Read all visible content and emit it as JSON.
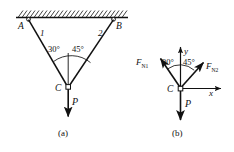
{
  "figure": {
    "background_color": "#ffffff",
    "stroke_color": "#111111"
  },
  "panel_a": {
    "caption": "(a)",
    "support_label_left": "A",
    "support_label_right": "B",
    "member_label_1": "1",
    "member_label_2": "2",
    "joint_label": "C",
    "load_label": "P",
    "angle_left": "30°",
    "angle_right": "45°",
    "hatching_name": "fixed-ceiling-hatching"
  },
  "panel_b": {
    "caption": "(b)",
    "joint_label": "C",
    "load_label": "P",
    "axis_y_label": "y",
    "axis_x_label": "x",
    "force_left_main": "F",
    "force_left_sub": "N1",
    "force_right_main": "F",
    "force_right_sub": "N2",
    "angle_left": "30°",
    "angle_right": "45°"
  }
}
